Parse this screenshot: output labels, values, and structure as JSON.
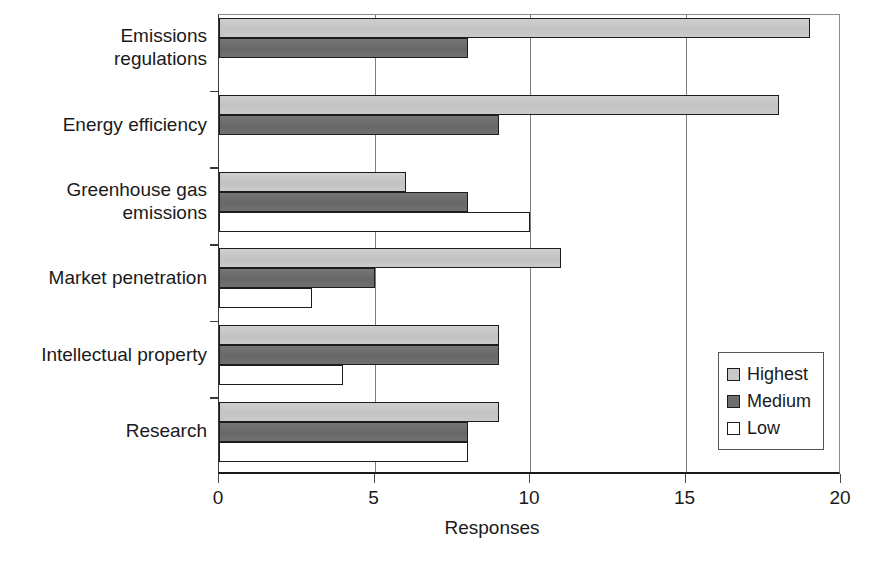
{
  "chart_data": {
    "type": "bar",
    "orientation": "horizontal",
    "title": "",
    "xlabel": "Responses",
    "ylabel": "",
    "xlim": [
      0,
      20
    ],
    "xticks": [
      0,
      5,
      10,
      15,
      20
    ],
    "xtick_labels": [
      "0",
      "5",
      "10",
      "15",
      "20"
    ],
    "grid": "vertical",
    "legend_position": "center-right-inside",
    "categories": [
      "Emissions regulations",
      "Energy efficiency",
      "Greenhouse gas emissions",
      "Market penetration",
      "Intellectual property",
      "Research"
    ],
    "category_lines": [
      [
        "Emissions",
        "regulations"
      ],
      [
        "Energy efficiency"
      ],
      [
        "Greenhouse gas",
        "emissions"
      ],
      [
        "Market penetration"
      ],
      [
        "Intellectual property"
      ],
      [
        "Research"
      ]
    ],
    "series": [
      {
        "name": "Highest",
        "color": "#c9c9c9",
        "values": [
          19,
          18,
          6,
          11,
          9,
          9
        ]
      },
      {
        "name": "Medium",
        "color": "#6e6e6e",
        "values": [
          8,
          9,
          8,
          5,
          9,
          8
        ]
      },
      {
        "name": "Low",
        "color": "#ffffff",
        "values": [
          0,
          0,
          10,
          3,
          4,
          8
        ]
      }
    ]
  },
  "legend": {
    "entries": [
      {
        "label": "Highest",
        "swatch": "highest"
      },
      {
        "label": "Medium",
        "swatch": "medium"
      },
      {
        "label": "Low",
        "swatch": "low"
      }
    ]
  },
  "axis": {
    "x_title": "Responses"
  }
}
